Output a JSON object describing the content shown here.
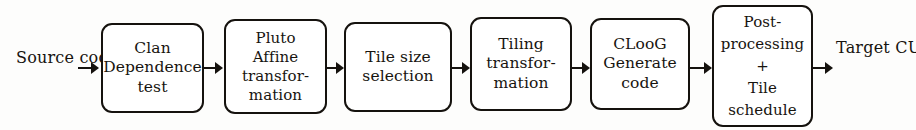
{
  "diagram": {
    "type": "flowchart",
    "orientation": "left-to-right",
    "colors": {
      "background": "#fdfdfc",
      "stroke": "#15120e",
      "text": "#17140f",
      "box_fill": "#ffffff"
    },
    "start_label": {
      "name": "source-code",
      "text": "Source\ncode"
    },
    "end_label": {
      "name": "target-cuda-code",
      "text": "Target\nCUDA\ncode"
    },
    "stages": [
      {
        "id": "clan",
        "name": "clan-dependence-test",
        "text": "Clan\nDependence\ntest",
        "x": 101,
        "y": 23,
        "w": 103,
        "h": 90
      },
      {
        "id": "pluto",
        "name": "pluto-affine-transformation",
        "text": "Pluto\nAffine\ntransfor-\nmation",
        "x": 224,
        "y": 19,
        "w": 103,
        "h": 95
      },
      {
        "id": "tilesize",
        "name": "tile-size-selection",
        "text": "Tile size\nselection",
        "x": 344,
        "y": 22,
        "w": 108,
        "h": 90
      },
      {
        "id": "tiling",
        "name": "tiling-transformation",
        "text": "Tiling\ntransfor-\nmation",
        "x": 470,
        "y": 17,
        "w": 102,
        "h": 94
      },
      {
        "id": "cloog",
        "name": "cloog-generate-code",
        "text": "CLooG\nGenerate\ncode",
        "x": 590,
        "y": 18,
        "w": 100,
        "h": 92
      },
      {
        "id": "post",
        "name": "post-processing-tile-schedule",
        "text": "Post-\nprocessing\n+\nTile\nschedule",
        "x": 712,
        "y": 5,
        "w": 101,
        "h": 122
      }
    ],
    "arrows": [
      {
        "name": "arrow-source-to-clan",
        "x": 78,
        "w": 22
      },
      {
        "name": "arrow-clan-to-pluto",
        "x": 203,
        "w": 21
      },
      {
        "name": "arrow-pluto-to-tilesize",
        "x": 326,
        "w": 19
      },
      {
        "name": "arrow-tilesize-to-tiling",
        "x": 451,
        "w": 20
      },
      {
        "name": "arrow-tiling-to-cloog",
        "x": 571,
        "w": 20
      },
      {
        "name": "arrow-cloog-to-post",
        "x": 689,
        "w": 24
      },
      {
        "name": "arrow-post-to-target",
        "x": 812,
        "w": 22
      }
    ]
  }
}
